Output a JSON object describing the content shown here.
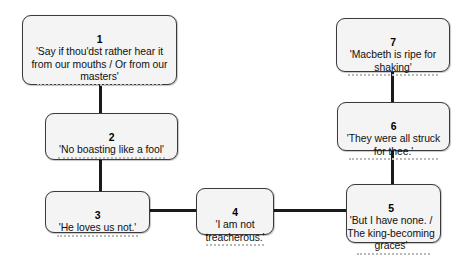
{
  "diagram": {
    "type": "flowchart",
    "background_color": "#ffffff",
    "box_fill_color": "#f4f4f4",
    "box_border_color": "#3a3a3a",
    "connector_color": "#1a1a1a",
    "dotted_line_color": "#b9b9b9",
    "nodes": [
      {
        "id": "node-1",
        "number": "1",
        "quote": "'Say if thou'dst rather hear it from our mouths / Or from our masters'",
        "note_placeholder": ""
      },
      {
        "id": "node-2",
        "number": "2",
        "quote": "'No boasting like a fool'",
        "note_placeholder": ""
      },
      {
        "id": "node-3",
        "number": "3",
        "quote": "'He loves us not.'",
        "note_placeholder": ""
      },
      {
        "id": "node-4",
        "number": "4",
        "quote": "'I am not treacherous.'",
        "note_placeholder": ""
      },
      {
        "id": "node-5",
        "number": "5",
        "quote": "'But I have none. / The king-becoming graces'",
        "note_placeholder": ""
      },
      {
        "id": "node-6",
        "number": "6",
        "quote": "'They were all struck for thee.'",
        "note_placeholder": ""
      },
      {
        "id": "node-7",
        "number": "7",
        "quote": "'Macbeth is ripe for shaking'",
        "note_placeholder": ""
      }
    ],
    "connections": [
      {
        "from": "node-1",
        "to": "node-2",
        "orientation": "vertical"
      },
      {
        "from": "node-2",
        "to": "node-3",
        "orientation": "vertical"
      },
      {
        "from": "node-3",
        "to": "node-4",
        "orientation": "horizontal"
      },
      {
        "from": "node-4",
        "to": "node-5",
        "orientation": "horizontal"
      },
      {
        "from": "node-5",
        "to": "node-6",
        "orientation": "vertical"
      },
      {
        "from": "node-6",
        "to": "node-7",
        "orientation": "vertical"
      }
    ]
  }
}
